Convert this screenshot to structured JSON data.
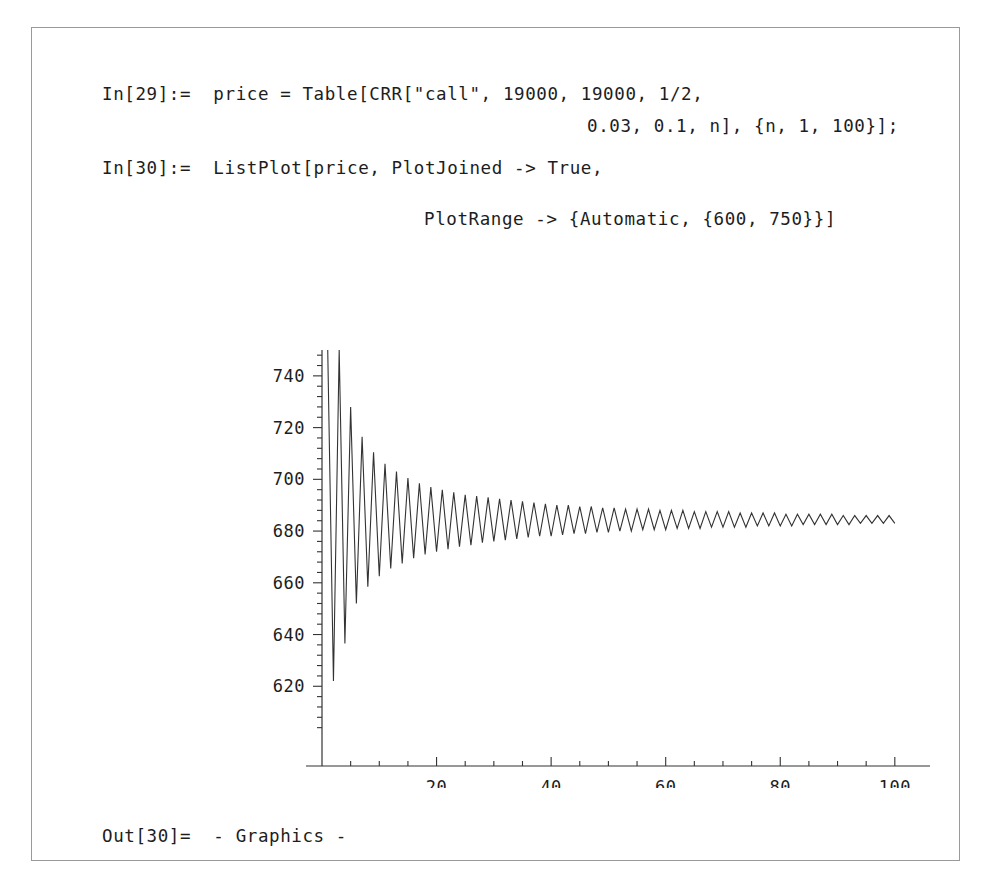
{
  "notebook": {
    "border_color": "#9a9a9a",
    "background": "#ffffff"
  },
  "cells": {
    "input_29": {
      "label": "In[29]:=",
      "line1": "In[29]:=  price = Table[CRR[\"call\", 19000, 19000, 1/2,",
      "line2": "0.03, 0.1, n], {n, 1, 100}];"
    },
    "input_30": {
      "label": "In[30]:=",
      "line1": "In[30]:=  ListPlot[price, PlotJoined -> True,",
      "line2": "PlotRange -> {Automatic, {600, 750}}]"
    },
    "output_30": {
      "label": "Out[30]=",
      "line1": "Out[30]=  - Graphics -"
    }
  },
  "chart_data": {
    "type": "line",
    "title": "",
    "xlabel": "",
    "ylabel": "",
    "xlim": [
      0,
      103
    ],
    "ylim": [
      600,
      750
    ],
    "grid": false,
    "legend": null,
    "line_color": "#333333",
    "axis_color": "#333333",
    "x_ticks_major": [
      20,
      40,
      60,
      80,
      100
    ],
    "x_tick_labels": [
      "20",
      "40",
      "60",
      "80",
      "100"
    ],
    "x_ticks_minor_step": 5,
    "y_ticks_major": [
      620,
      640,
      660,
      680,
      700,
      720,
      740
    ],
    "y_tick_labels": [
      "620",
      "640",
      "660",
      "680",
      "700",
      "720",
      "740"
    ],
    "y_ticks_minor_step": 4,
    "series_name": "price",
    "x": [
      1,
      2,
      3,
      4,
      5,
      6,
      7,
      8,
      9,
      10,
      11,
      12,
      13,
      14,
      15,
      16,
      17,
      18,
      19,
      20,
      21,
      22,
      23,
      24,
      25,
      26,
      27,
      28,
      29,
      30,
      31,
      32,
      33,
      34,
      35,
      36,
      37,
      38,
      39,
      40,
      41,
      42,
      43,
      44,
      45,
      46,
      47,
      48,
      49,
      50,
      51,
      52,
      53,
      54,
      55,
      56,
      57,
      58,
      59,
      60,
      61,
      62,
      63,
      64,
      65,
      66,
      67,
      68,
      69,
      70,
      71,
      72,
      73,
      74,
      75,
      76,
      77,
      78,
      79,
      80,
      81,
      82,
      83,
      84,
      85,
      86,
      87,
      88,
      89,
      90,
      91,
      92,
      93,
      94,
      95,
      96,
      97,
      98,
      99,
      100
    ],
    "values": [
      757.0,
      622.0,
      751.5,
      636.5,
      728.0,
      652.0,
      716.5,
      658.5,
      710.5,
      662.5,
      706.0,
      665.5,
      703.0,
      667.5,
      700.5,
      669.5,
      698.5,
      671.0,
      697.0,
      672.0,
      696.0,
      673.0,
      695.0,
      674.0,
      694.0,
      674.5,
      693.5,
      675.5,
      693.0,
      676.0,
      692.5,
      676.5,
      692.0,
      677.0,
      691.5,
      677.5,
      691.0,
      678.0,
      690.5,
      678.0,
      690.0,
      678.5,
      690.0,
      679.0,
      689.5,
      679.0,
      689.5,
      679.5,
      689.0,
      679.5,
      689.0,
      680.0,
      688.5,
      680.0,
      688.5,
      680.5,
      688.5,
      680.5,
      688.0,
      680.5,
      688.0,
      681.0,
      688.0,
      681.0,
      687.5,
      681.0,
      687.5,
      681.5,
      687.5,
      681.5,
      687.5,
      681.5,
      687.0,
      681.5,
      687.0,
      682.0,
      687.0,
      682.0,
      687.0,
      682.0,
      686.5,
      682.0,
      686.5,
      682.5,
      686.5,
      682.5,
      686.5,
      682.5,
      686.5,
      682.5,
      686.0,
      682.5,
      686.0,
      683.0,
      686.0,
      683.0,
      686.0,
      683.0,
      686.0,
      683.0
    ],
    "converged_value": 684.5
  }
}
